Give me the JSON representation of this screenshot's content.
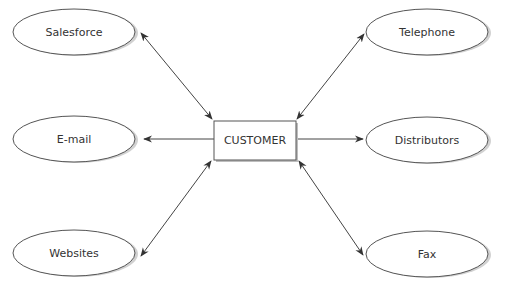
{
  "diagram": {
    "center": {
      "label": "CUSTOMER",
      "x": 214,
      "y": 121,
      "w": 82,
      "h": 39
    },
    "nodes": [
      {
        "id": "salesforce",
        "label": "Salesforce",
        "cx": 74,
        "cy": 32,
        "rx": 61,
        "ry": 23
      },
      {
        "id": "email",
        "label": "E-mail",
        "cx": 74,
        "cy": 139,
        "rx": 61,
        "ry": 23
      },
      {
        "id": "websites",
        "label": "Websites",
        "cx": 74,
        "cy": 253,
        "rx": 61,
        "ry": 23
      },
      {
        "id": "telephone",
        "label": "Telephone",
        "cx": 427,
        "cy": 32,
        "rx": 61,
        "ry": 23
      },
      {
        "id": "distributors",
        "label": "Distributors",
        "cx": 427,
        "cy": 140,
        "rx": 61,
        "ry": 23
      },
      {
        "id": "fax",
        "label": "Fax",
        "cx": 427,
        "cy": 254,
        "rx": 61,
        "ry": 23
      }
    ],
    "edges": [
      {
        "id": "customer-salesforce",
        "from": "customer",
        "to": "salesforce",
        "x1": 212,
        "y1": 119,
        "x2": 141,
        "y2": 33,
        "direction": "both"
      },
      {
        "id": "customer-email",
        "from": "customer",
        "to": "email",
        "x1": 214,
        "y1": 139,
        "x2": 144,
        "y2": 139,
        "direction": "to"
      },
      {
        "id": "customer-websites",
        "from": "customer",
        "to": "websites",
        "x1": 211,
        "y1": 161,
        "x2": 141,
        "y2": 256,
        "direction": "both"
      },
      {
        "id": "customer-telephone",
        "from": "customer",
        "to": "telephone",
        "x1": 297,
        "y1": 119,
        "x2": 364,
        "y2": 34,
        "direction": "both"
      },
      {
        "id": "customer-distributors",
        "from": "customer",
        "to": "distributors",
        "x1": 296,
        "y1": 139,
        "x2": 363,
        "y2": 139,
        "direction": "to"
      },
      {
        "id": "customer-fax",
        "from": "customer",
        "to": "fax",
        "x1": 299,
        "y1": 161,
        "x2": 363,
        "y2": 255,
        "direction": "both"
      }
    ]
  },
  "colors": {
    "stroke": "#444444",
    "text": "#333333",
    "shadow": "#bdbdbd",
    "fill": "#ffffff"
  }
}
